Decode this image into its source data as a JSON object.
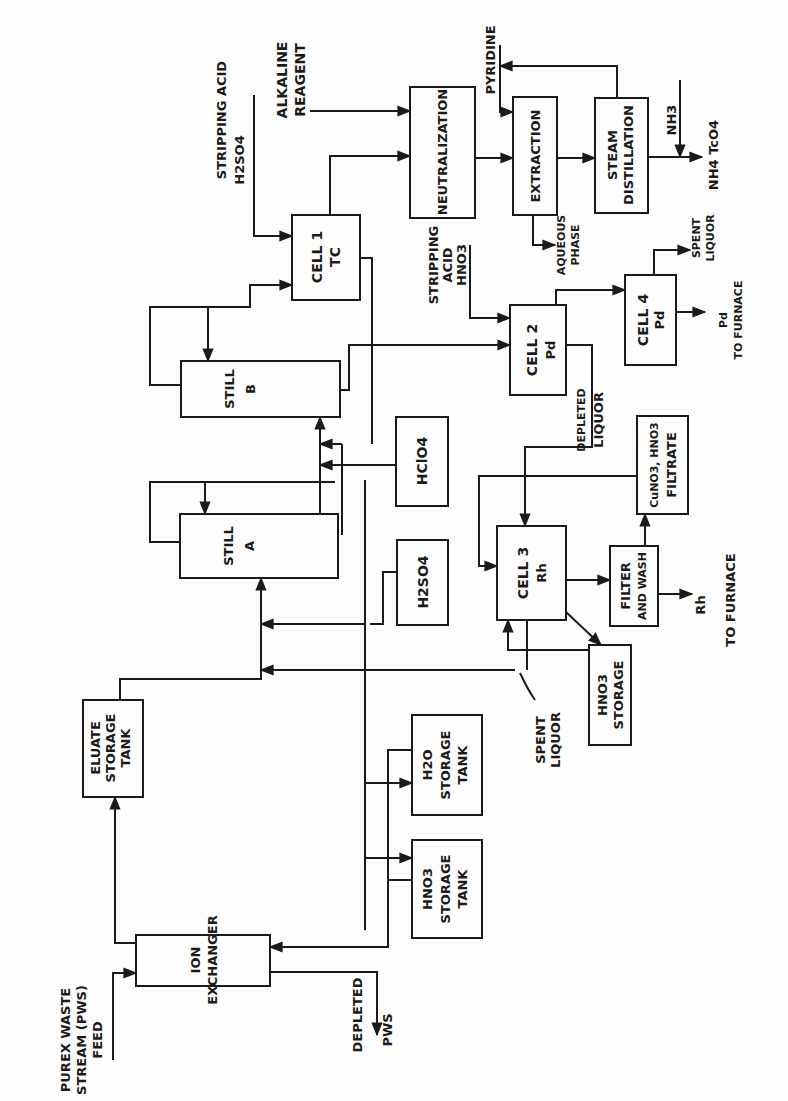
{
  "diagram": {
    "type": "process-flow",
    "orientation": "rotated-90-ccw",
    "line_color": "#1a1a1a",
    "background": "#fdfdfd"
  },
  "units": {
    "ion_exchanger": {
      "line1": "ION",
      "line2": "EXCHANGER"
    },
    "eluate_tank": {
      "line1": "ELUATE",
      "line2": "STORAGE",
      "line3": "TANK"
    },
    "still_a": {
      "line1": "STILL",
      "line2": "A"
    },
    "still_b": {
      "line1": "STILL",
      "line2": "B"
    },
    "cell1": {
      "line1": "CELL 1",
      "line2": "TC"
    },
    "neutralization": {
      "line1": "NEUTRALIZATION"
    },
    "extraction": {
      "line1": "EXTRACTION"
    },
    "steam_distillation": {
      "line1": "STEAM",
      "line2": "DISTILLATION"
    },
    "cell2": {
      "line1": "CELL 2",
      "line2": "Pd"
    },
    "cell4": {
      "line1": "CELL 4",
      "line2": "Pd"
    },
    "hclo4": {
      "line1": "HClO4"
    },
    "h2so4": {
      "line1": "H2SO4"
    },
    "h2o_tank": {
      "line1": "H2O",
      "line2": "STORAGE",
      "line3": "TANK"
    },
    "hno3_tank": {
      "line1": "HNO3",
      "line2": "STORAGE",
      "line3": "TANK"
    },
    "cell3": {
      "line1": "CELL 3",
      "line2": "Rh"
    },
    "filter_wash": {
      "line1": "FILTER",
      "line2": "AND WASH"
    },
    "filtrates": {
      "line1": "CuNO3, HNO3",
      "line2": "FILTRATE"
    },
    "hno3_storage": {
      "line1": "HNO3",
      "line2": "STORAGE"
    }
  },
  "streams": {
    "purex_feed": {
      "line1": "PUREX WASTE",
      "line2": "STREAM (PWS)",
      "line3": "FEED"
    },
    "depleted_pws": {
      "line1": "DEPLETED",
      "line2": "PWS"
    },
    "stripping_h2so4": {
      "line1": "STRIPPING ACID",
      "line2": "H2SO4"
    },
    "alkaline_reagent": {
      "line1": "ALKALINE",
      "line2": "REAGENT"
    },
    "pyridine": {
      "line1": "PYRIDINE"
    },
    "aqueous_phase": {
      "line1": "AQUEOUS",
      "line2": "PHASE"
    },
    "nh3": {
      "line1": "NH3"
    },
    "nh4tco4": {
      "line1": "NH4 TcO4"
    },
    "stripping_hno3": {
      "line1": "STRIPPING",
      "line2": "ACID",
      "line3": "HNO3"
    },
    "spent_liquor_pd": {
      "line1": "SPENT",
      "line2": "LIQUOR"
    },
    "pd_furnace": {
      "line1": "Pd",
      "line2": "TO FURNACE"
    },
    "depleted_liquor": {
      "line1": "DEPLETED",
      "line2": "LIQUOR"
    },
    "rh_furnace": {
      "line1": "Rh",
      "line2": "TO FURNACE"
    },
    "spent_liquor_rh": {
      "line1": "SPENT",
      "line2": "LIQUOR"
    }
  }
}
